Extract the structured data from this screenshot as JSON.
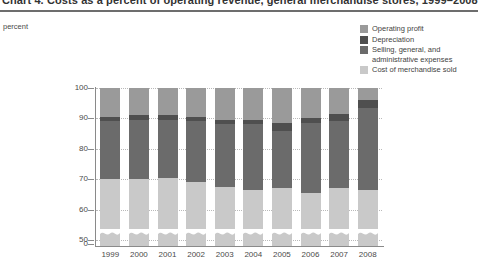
{
  "header": {
    "title": "Chart 4. Costs as a percent of operating revenue, general merchandise stores, 1999–2008",
    "rule_color": "#6d6d6d"
  },
  "unit_label": "percent",
  "legend": {
    "position": "top-right",
    "items": [
      {
        "label": "Operating profit",
        "label_line2": "",
        "color": "#9a9a9a"
      },
      {
        "label": "Depreciation",
        "label_line2": "",
        "color": "#4f4f4f"
      },
      {
        "label": "Selling, general, and",
        "label_line2": "administrative expenses",
        "color": "#6b6b6b"
      },
      {
        "label": "Cost of merchandise sold",
        "label_line2": "",
        "color": "#c9c9c9"
      }
    ]
  },
  "chart_data": {
    "type": "bar",
    "stacked": true,
    "title": "Chart 4. Costs as a percent of operating revenue, general merchandise stores, 1999–2008",
    "xlabel": "",
    "ylabel": "percent",
    "ylim": [
      0,
      100
    ],
    "yticks": [
      0,
      50,
      60,
      70,
      80,
      90,
      100
    ],
    "ytick_labels": [
      "0",
      "50",
      "60",
      "70",
      "80",
      "90",
      "100"
    ],
    "axis_break": true,
    "axis_break_note": "y-axis broken between 0 and 50",
    "grid": "horizontal-dotted",
    "legend_position": "top-right",
    "categories": [
      "1999",
      "2000",
      "2001",
      "2002",
      "2003",
      "2004",
      "2005",
      "2006",
      "2007",
      "2008"
    ],
    "series": [
      {
        "name": "Cost of merchandise sold",
        "color": "#c9c9c9",
        "values": [
          70.0,
          70.0,
          70.5,
          69.0,
          67.5,
          66.5,
          67.0,
          65.5,
          67.0,
          66.5
        ]
      },
      {
        "name": "Selling, general, and administrative expenses",
        "color": "#6b6b6b",
        "values": [
          19.0,
          19.5,
          19.0,
          20.0,
          20.5,
          21.5,
          19.0,
          23.0,
          22.0,
          27.0
        ]
      },
      {
        "name": "Depreciation",
        "color": "#4f4f4f",
        "values": [
          1.5,
          1.5,
          1.5,
          1.5,
          1.5,
          1.5,
          2.5,
          1.5,
          2.5,
          2.5
        ]
      },
      {
        "name": "Operating profit",
        "color": "#9a9a9a",
        "values": [
          9.5,
          9.0,
          9.0,
          9.5,
          10.5,
          10.5,
          11.5,
          10.0,
          8.5,
          4.0
        ]
      }
    ],
    "cumulative_tops": {
      "cost_of_merchandise_sold": [
        70.0,
        70.0,
        70.5,
        69.0,
        67.5,
        66.5,
        67.0,
        65.5,
        67.0,
        66.5
      ],
      "sga": [
        89.0,
        89.5,
        89.5,
        89.0,
        88.0,
        88.0,
        86.0,
        88.5,
        89.0,
        93.5
      ],
      "depreciation": [
        90.5,
        91.0,
        91.0,
        90.5,
        89.5,
        89.5,
        88.5,
        90.0,
        91.5,
        96.0
      ],
      "operating_profit": [
        100,
        100,
        100,
        100,
        100,
        100,
        100,
        100,
        100,
        100
      ]
    }
  }
}
